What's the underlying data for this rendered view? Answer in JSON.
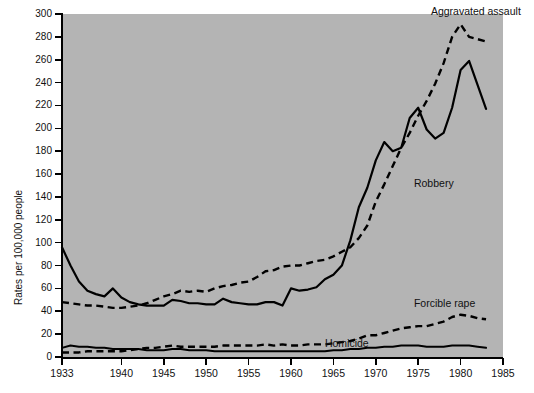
{
  "chart_data": {
    "type": "line",
    "title": "",
    "xlabel": "",
    "ylabel": "Rates per 100,000 people",
    "xlim": [
      1933,
      1985
    ],
    "ylim": [
      0,
      300
    ],
    "grid": false,
    "legend_position": "inline-annotations",
    "xticks": [
      "1933",
      "1940",
      "1945",
      "1950",
      "1955",
      "1960",
      "1965",
      "1970",
      "1975",
      "1980",
      "1985"
    ],
    "yticks": [
      "0",
      "20",
      "40",
      "60",
      "80",
      "100",
      "120",
      "140",
      "160",
      "180",
      "200",
      "220",
      "240",
      "260",
      "280",
      "300"
    ],
    "x": [
      1933,
      1934,
      1935,
      1936,
      1937,
      1938,
      1939,
      1940,
      1941,
      1942,
      1943,
      1944,
      1945,
      1946,
      1947,
      1948,
      1949,
      1950,
      1951,
      1952,
      1953,
      1954,
      1955,
      1956,
      1957,
      1958,
      1959,
      1960,
      1961,
      1962,
      1963,
      1964,
      1965,
      1966,
      1967,
      1968,
      1969,
      1970,
      1971,
      1972,
      1973,
      1974,
      1975,
      1976,
      1977,
      1978,
      1979,
      1980,
      1981,
      1982,
      1983
    ],
    "series": [
      {
        "name": "Aggravated assault",
        "style": "dashed",
        "label_x": 1976.5,
        "label_y": 303,
        "values": [
          48,
          47,
          46,
          45,
          45,
          44,
          43,
          43,
          44,
          45,
          47,
          50,
          53,
          55,
          58,
          57,
          58,
          57,
          60,
          62,
          63,
          65,
          66,
          70,
          75,
          76,
          79,
          80,
          80,
          82,
          84,
          85,
          88,
          92,
          96,
          104,
          115,
          136,
          151,
          167,
          183,
          196,
          211,
          224,
          239,
          257,
          280,
          291,
          280,
          278,
          276
        ]
      },
      {
        "name": "Robbery",
        "style": "solid",
        "label_x": 1974.5,
        "label_y": 152,
        "values": [
          96,
          80,
          66,
          58,
          55,
          53,
          60,
          52,
          48,
          46,
          45,
          45,
          45,
          50,
          49,
          47,
          47,
          46,
          46,
          51,
          48,
          47,
          46,
          46,
          48,
          48,
          45,
          60,
          58,
          59,
          61,
          68,
          72,
          80,
          102,
          131,
          148,
          172,
          188,
          180,
          183,
          209,
          218,
          199,
          191,
          196,
          218,
          251,
          259,
          238,
          217
        ]
      },
      {
        "name": "Forcible rape",
        "style": "dashed",
        "label_x": 1974.5,
        "label_y": 47,
        "values": [
          4,
          4,
          4,
          5,
          5,
          5,
          5,
          5,
          6,
          7,
          8,
          8,
          9,
          10,
          9,
          9,
          9,
          9,
          9,
          10,
          10,
          10,
          10,
          10,
          11,
          10,
          11,
          10,
          10,
          11,
          11,
          11,
          12,
          13,
          14,
          16,
          19,
          19,
          21,
          23,
          25,
          26,
          27,
          27,
          29,
          31,
          35,
          37,
          36,
          34,
          33
        ]
      },
      {
        "name": "Homicide",
        "style": "solid",
        "label_x": 1964.0,
        "label_y": 12,
        "values": [
          8,
          10,
          9,
          9,
          8,
          8,
          7,
          7,
          7,
          7,
          6,
          6,
          6,
          7,
          7,
          6,
          6,
          6,
          5,
          5,
          5,
          5,
          5,
          5,
          5,
          5,
          5,
          5,
          5,
          5,
          5,
          5,
          6,
          6,
          7,
          7,
          8,
          8,
          9,
          9,
          10,
          10,
          10,
          9,
          9,
          9,
          10,
          10,
          10,
          9,
          8
        ]
      }
    ]
  }
}
